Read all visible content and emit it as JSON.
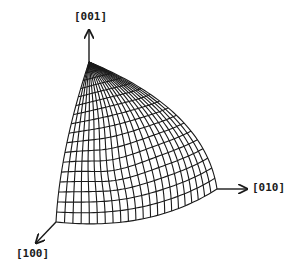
{
  "diagram": {
    "title": "",
    "axes": [
      {
        "id": "z",
        "label": "[001]",
        "from": [
          89,
          62
        ],
        "to": [
          89,
          30
        ],
        "label_pos": [
          74,
          10
        ]
      },
      {
        "id": "y",
        "label": "[010]",
        "from": [
          217,
          189
        ],
        "to": [
          247,
          189
        ],
        "label_pos": [
          252,
          181
        ]
      },
      {
        "id": "x",
        "label": "[100]",
        "from": [
          56,
          222
        ],
        "to": [
          36,
          243
        ],
        "label_pos": [
          16,
          247
        ]
      }
    ],
    "surface": {
      "pole": [
        89,
        62
      ],
      "left_edge_ctrl": [
        [
          78,
          80
        ],
        [
          60,
          150
        ],
        [
          56,
          222
        ]
      ],
      "right_edge_ctrl": [
        [
          140,
          62
        ],
        [
          205,
          110
        ],
        [
          217,
          189
        ]
      ],
      "bottom_edge_ctrl": [
        [
          56,
          222
        ],
        [
          150,
          232
        ],
        [
          217,
          189
        ]
      ],
      "valley": {
        "center": [
          115,
          168
        ],
        "depth": 14
      },
      "u_lines": 22,
      "v_lines": 18,
      "stroke_color": "#1a1a1a",
      "stroke_width": 1.1
    },
    "colors": {
      "background": "#ffffff",
      "ink": "#1a1a1a"
    }
  }
}
